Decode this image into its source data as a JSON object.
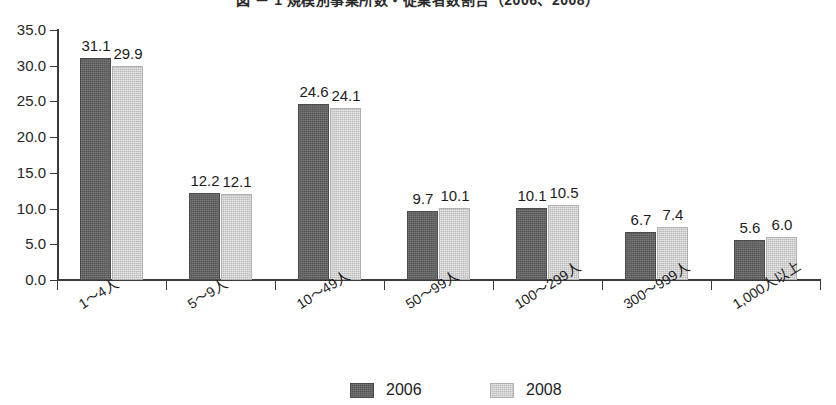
{
  "chart_data": {
    "type": "bar",
    "title": "図 － 1  規模別事業所数・従業者数割合（2006、2008）",
    "xlabel": "",
    "ylabel": "",
    "categories": [
      "1〜4人",
      "5〜9人",
      "10〜49人",
      "50〜99人",
      "100〜299人",
      "300〜999人",
      "1,000人以上"
    ],
    "series": [
      {
        "name": "2006",
        "color": "#565656",
        "values": [
          31.1,
          12.2,
          24.6,
          9.7,
          10.1,
          6.7,
          5.6
        ]
      },
      {
        "name": "2008",
        "color": "#bcbcbc",
        "values": [
          29.9,
          12.1,
          24.1,
          10.1,
          10.5,
          7.4,
          6.0
        ]
      }
    ],
    "ylim": [
      0,
      35
    ],
    "ytick_values": [
      0,
      5,
      10,
      15,
      20,
      25,
      30,
      35
    ],
    "ytick_labels": [
      "0.0",
      "5.0",
      "10.0",
      "15.0",
      "20.0",
      "25.0",
      "30.0",
      "35.0"
    ],
    "grid": false,
    "legend_position": "bottom-center",
    "data_labels": true
  },
  "legend": {
    "items": [
      {
        "label": "2006",
        "swatch": "dark-gray-swatch"
      },
      {
        "label": "2008",
        "swatch": "light-gray-swatch"
      }
    ]
  }
}
